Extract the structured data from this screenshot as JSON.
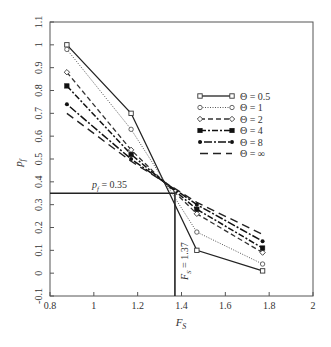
{
  "chart_data": {
    "type": "line",
    "title": "",
    "xlabel": "F_S",
    "ylabel": "p_f",
    "xlim": [
      0.8,
      2.0
    ],
    "ylim": [
      -0.1,
      1.1
    ],
    "xticks": [
      0.8,
      1,
      1.2,
      1.4,
      1.6,
      1.8,
      2
    ],
    "xtick_labels": [
      "0.8",
      "1",
      "1.2",
      "1.4",
      "1.6",
      "1.8",
      "2"
    ],
    "yticks": [
      -0.1,
      0,
      0.1,
      0.2,
      0.3,
      0.4,
      0.5,
      0.6,
      0.7,
      0.8,
      0.9,
      1,
      1.1
    ],
    "ytick_labels": [
      "-0.1",
      "0",
      "0.1",
      "0.2",
      "0.3",
      "0.4",
      "0.5",
      "0.6",
      "0.7",
      "0.8",
      "0.9",
      "1",
      "1.1"
    ],
    "grid": false,
    "legend_position": "upper right (inside)",
    "x": [
      0.877,
      1.17,
      1.47,
      1.77
    ],
    "series": [
      {
        "name": "Θ = 0.5",
        "values": [
          1.0,
          0.7,
          0.1,
          0.01
        ],
        "style": "solid",
        "marker": "square-open"
      },
      {
        "name": "Θ = 1",
        "values": [
          0.98,
          0.63,
          0.18,
          0.04
        ],
        "style": "dotted",
        "marker": "circle-open"
      },
      {
        "name": "Θ = 2",
        "values": [
          0.88,
          0.54,
          0.26,
          0.09
        ],
        "style": "dashed",
        "marker": "diamond-open"
      },
      {
        "name": "Θ = 4",
        "values": [
          0.82,
          0.52,
          0.28,
          0.11
        ],
        "style": "dash-dot",
        "marker": "square-filled"
      },
      {
        "name": "Θ = 8",
        "values": [
          0.74,
          0.5,
          0.3,
          0.14
        ],
        "style": "dash-dot-dot",
        "marker": "circle-filled"
      },
      {
        "name": "Θ = ∞",
        "values": [
          0.7,
          0.49,
          0.31,
          0.17
        ],
        "style": "long-dash",
        "marker": "none"
      }
    ],
    "annotations": [
      {
        "text": "p_f = 0.35",
        "type": "horizontal-reference",
        "y": 0.35,
        "x_from": 0.8,
        "x_to": 1.37
      },
      {
        "text": "F_S = 1.37",
        "type": "vertical-reference",
        "x": 1.37,
        "y_from": -0.1,
        "y_to": 0.35
      }
    ]
  },
  "labels": {
    "xlabel_main": "F",
    "xlabel_sub": "S",
    "ylabel_main": "p",
    "ylabel_sub": "f",
    "pf_annot_main": "p",
    "pf_annot_sub": "f",
    "pf_annot_value": " = 0.35",
    "fs_annot_main": "F",
    "fs_annot_sub": "S",
    "fs_annot_value": " = 1.37"
  },
  "legend": [
    {
      "label": "Θ = 0.5"
    },
    {
      "label": "Θ = 1"
    },
    {
      "label": "Θ = 2"
    },
    {
      "label": "Θ = 4"
    },
    {
      "label": "Θ = 8"
    },
    {
      "label": "Θ = ∞"
    }
  ]
}
